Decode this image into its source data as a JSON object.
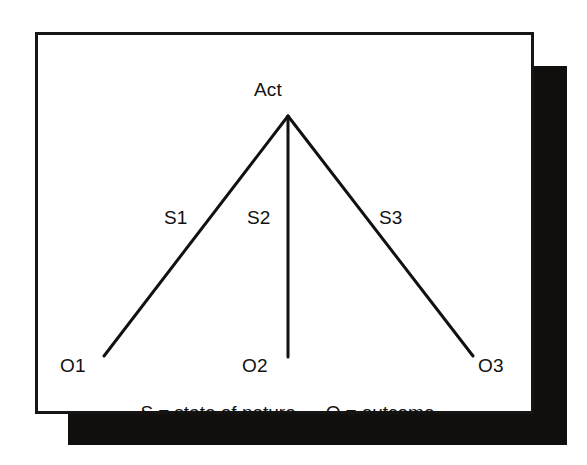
{
  "figure": {
    "title_label": "Act",
    "colors": {
      "ink": "#111111",
      "border": "#171513",
      "shadow": "#100f0d",
      "card_background": "#ffffff",
      "page_background": "#ffffff"
    },
    "root": {
      "label": "Act"
    },
    "branches": [
      {
        "state_label": "S1",
        "outcome_label": "O1"
      },
      {
        "state_label": "S2",
        "outcome_label": "O2"
      },
      {
        "state_label": "S3",
        "outcome_label": "O3"
      }
    ],
    "legend": [
      {
        "symbol": "S",
        "equals": "=",
        "meaning": "state of nature"
      },
      {
        "symbol": "O",
        "equals": "=",
        "meaning": "outcome"
      }
    ]
  }
}
